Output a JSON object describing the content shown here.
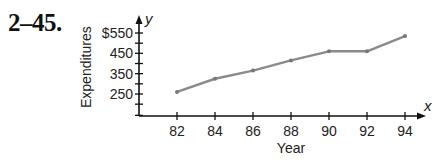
{
  "problem_number": "2–45.",
  "chart_data": {
    "type": "line",
    "title": "",
    "xlabel": "Year",
    "ylabel": "Expenditures",
    "x_axis_var": "x",
    "y_axis_var": "y",
    "categories": [
      "82",
      "84",
      "86",
      "88",
      "90",
      "92",
      "94"
    ],
    "x": [
      82,
      84,
      86,
      88,
      90,
      92,
      94
    ],
    "values": [
      260,
      325,
      365,
      415,
      460,
      460,
      535
    ],
    "y_ticks": [
      250,
      350,
      450,
      550
    ],
    "y_tick_labels": [
      "250",
      "350",
      "450",
      "$550"
    ],
    "y_minor_tick_step": 50,
    "ylim": [
      150,
      575
    ],
    "grid": false,
    "legend": null,
    "line_color": "#8a8a8a"
  }
}
